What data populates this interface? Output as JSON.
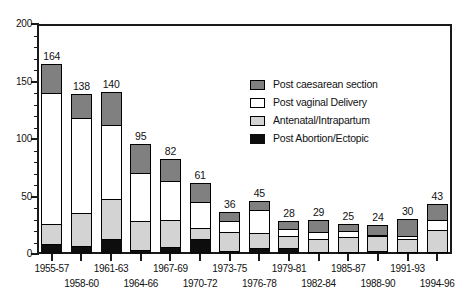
{
  "chart_data": {
    "type": "bar",
    "subtype": "stacked",
    "title": "",
    "xlabel": "",
    "ylabel": "",
    "ylim": [
      0,
      200
    ],
    "ytick_labels": [
      "0",
      "50",
      "100",
      "150",
      "200"
    ],
    "ytick_values": [
      0,
      50,
      100,
      150,
      200
    ],
    "yminor_interval": 10,
    "grid": false,
    "legend_position": "inside-upper-right",
    "categories": [
      "1955-57",
      "1958-60",
      "1961-63",
      "1964-66",
      "1967-69",
      "1970-72",
      "1973-75",
      "1976-78",
      "1979-81",
      "1982-84",
      "1985-87",
      "1988-90",
      "1991-93",
      "1994-96"
    ],
    "totals": [
      164,
      138,
      140,
      95,
      82,
      61,
      36,
      45,
      28,
      29,
      25,
      24,
      30,
      43
    ],
    "series": [
      {
        "name": "Post Abortion/Ectopic",
        "color": "#0d0d0d",
        "values": [
          8,
          6,
          12,
          3,
          5,
          12,
          2,
          4,
          4,
          1,
          1,
          2,
          1,
          1
        ]
      },
      {
        "name": "Antenatal/Intrapartum",
        "color": "#d3d3d3",
        "values": [
          17,
          29,
          35,
          25,
          24,
          10,
          16,
          13,
          11,
          11,
          13,
          13,
          11,
          19
        ]
      },
      {
        "name": "Post vaginal Delivery",
        "color": "#ffffff",
        "values": [
          114,
          82,
          64,
          42,
          34,
          22,
          10,
          20,
          6,
          6,
          5,
          1,
          3,
          9
        ]
      },
      {
        "name": "Post caesarean section",
        "color": "#808080",
        "values": [
          25,
          21,
          29,
          25,
          19,
          17,
          8,
          8,
          7,
          11,
          6,
          8,
          15,
          14
        ]
      }
    ],
    "legend_entries": [
      {
        "label": "Post caesarean section",
        "color": "#808080"
      },
      {
        "label": "Post vaginal Delivery",
        "color": "#ffffff"
      },
      {
        "label": "Antenatal/Intrapartum",
        "color": "#d3d3d3"
      },
      {
        "label": "Post Abortion/Ectopic",
        "color": "#0d0d0d"
      }
    ]
  }
}
